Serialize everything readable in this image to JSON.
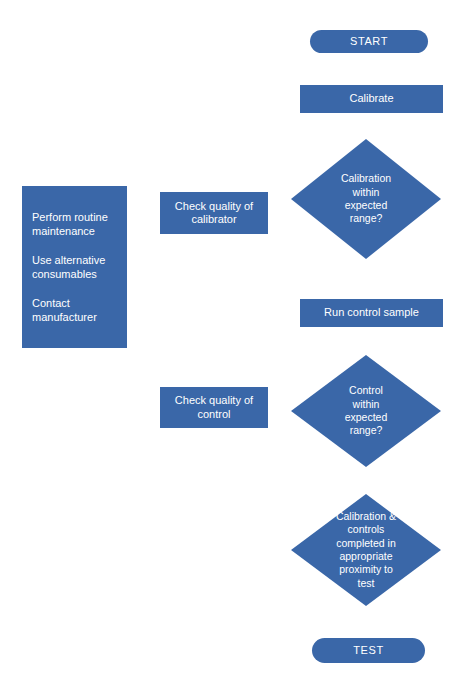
{
  "diagram": {
    "background_color": "#ffffff",
    "shape_color": "#3a67a8",
    "text_color": "#ffffff"
  },
  "main_flow": {
    "start": {
      "label": "START",
      "shape": "terminator"
    },
    "calibrate": {
      "label": "Calibrate",
      "shape": "process"
    },
    "calibration_decision": {
      "label": "Calibration\nwithin\nexpected\nrange?",
      "shape": "decision"
    },
    "run_control_sample": {
      "label": "Run control sample",
      "shape": "process"
    },
    "control_decision": {
      "label": "Control\nwithin\nexpected\nrange?",
      "shape": "decision"
    },
    "proximity_decision": {
      "label": "Calibration &\ncontrols\ncompleted in\nappropriate\nproximity to\ntest",
      "shape": "decision"
    },
    "test": {
      "label": "TEST",
      "shape": "terminator"
    }
  },
  "side_branch": {
    "check_calibrator": {
      "label": "Check quality of\ncalibrator",
      "shape": "process"
    },
    "check_control": {
      "label": "Check quality of\ncontrol",
      "shape": "process"
    }
  },
  "actions_panel": {
    "shape": "process",
    "items": [
      {
        "label": "Perform routine\nmaintenance"
      },
      {
        "label": "Use alternative\nconsumables"
      },
      {
        "label": "Contact\nmanufacturer"
      }
    ]
  }
}
